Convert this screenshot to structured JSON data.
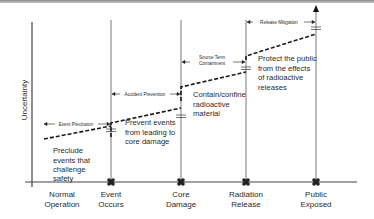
{
  "diagram": {
    "ylabel": "Uncertainty",
    "stages": [
      {
        "label_line1": "Normal",
        "label_line2": "Operation",
        "x": 62
      },
      {
        "label_line1": "Event",
        "label_line2": "Occurs",
        "x": 111
      },
      {
        "label_line1": "Core",
        "label_line2": "Damage",
        "x": 181
      },
      {
        "label_line1": "Radiation",
        "label_line2": "Release",
        "x": 246
      },
      {
        "label_line1": "Public",
        "label_line2": "Exposed",
        "x": 316
      }
    ],
    "phases": [
      {
        "label": "Event Precluion",
        "label_text": "Event Preclusion"
      },
      {
        "label": "Accident Prevention"
      },
      {
        "label_line1": "Source Term",
        "label_line2": "Containment"
      },
      {
        "label": "Release Mitigation"
      }
    ],
    "descriptions": [
      {
        "lines": [
          "Preclude",
          "events that",
          "challenge",
          "safety"
        ]
      },
      {
        "lines": [
          "Prevent events",
          "from leading to",
          "core damage"
        ]
      },
      {
        "lines": [
          "Contain/confine",
          "radioactive",
          "material"
        ]
      },
      {
        "lines": [
          "Protect the public",
          "from the effects",
          "of radioactive",
          "releases"
        ]
      }
    ],
    "colors": {
      "line": "#1a1a1a",
      "vertical": "#555555",
      "marker": "#222222",
      "text": "#2a2a2a"
    }
  }
}
